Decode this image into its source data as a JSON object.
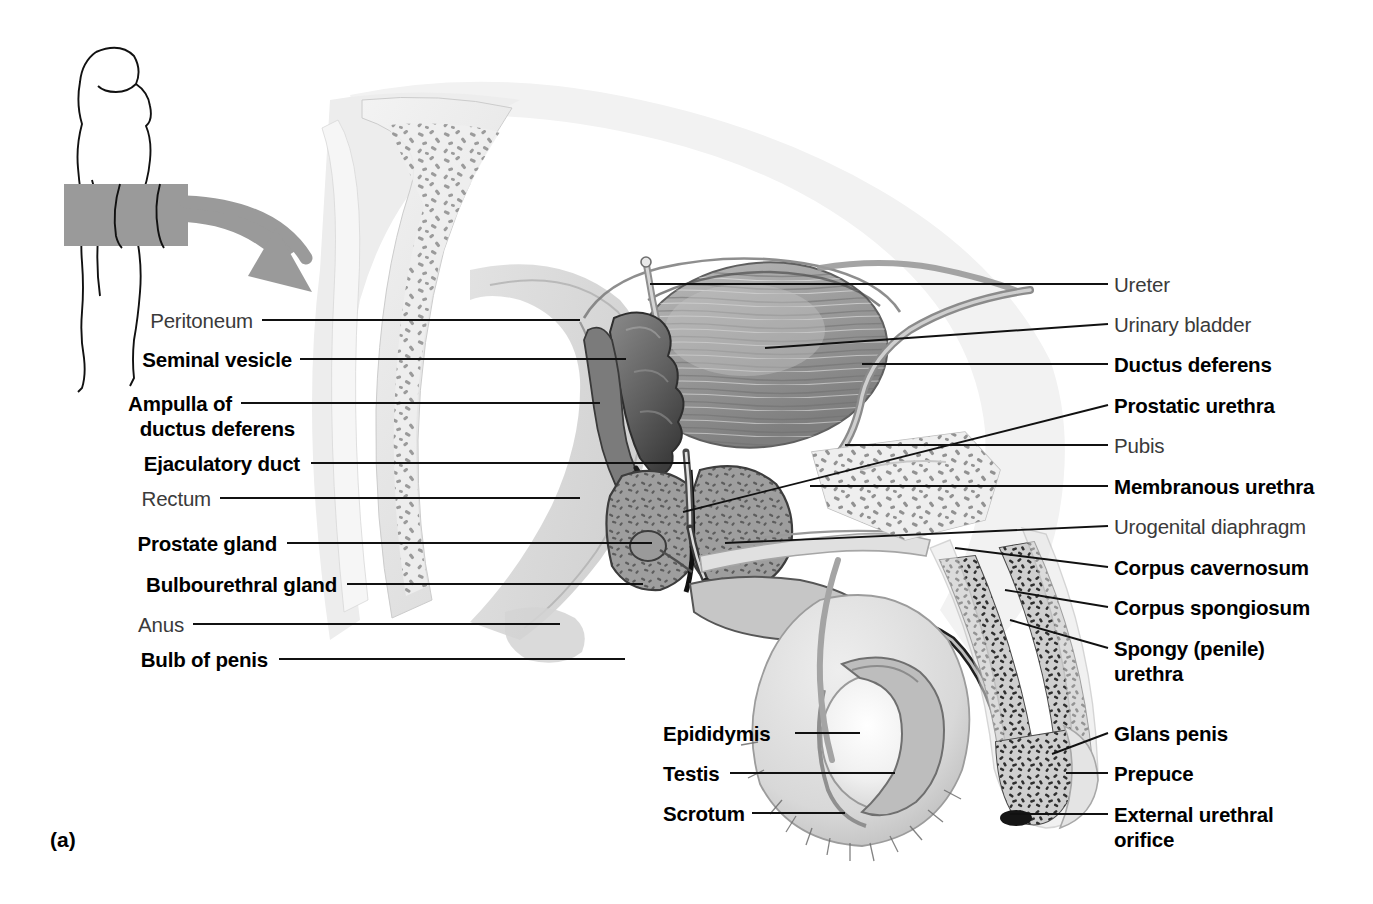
{
  "figure": {
    "letter": "(a)",
    "orientation_icon": "body-silhouette-icon",
    "pointer_icon": "curved-arrow-icon",
    "colors": {
      "background": "#ffffff",
      "line": "#111111",
      "accent_gray": "#9a9a9a",
      "label_bold": "#000000",
      "label_plain": "#3a3a3a"
    }
  },
  "labels_left": [
    {
      "text": "Peritoneum",
      "weight": "plain",
      "x": 253,
      "y": 309,
      "line_x1": 262,
      "line_y1": 320,
      "line_x2": 580,
      "line_y2": 320
    },
    {
      "text": "Seminal vesicle",
      "weight": "bold",
      "x": 292,
      "y": 348,
      "line_x1": 300,
      "line_y1": 359,
      "line_x2": 626,
      "line_y2": 359
    },
    {
      "text": "Ampulla of",
      "weight": "bold",
      "x": 232,
      "y": 392,
      "line_x1": 241,
      "line_y1": 403,
      "line_x2": 600,
      "line_y2": 403
    },
    {
      "text": "ductus deferens",
      "weight": "bold",
      "x": 295,
      "y": 417,
      "line_x1": null,
      "line_y1": null,
      "line_x2": null,
      "line_y2": null
    },
    {
      "text": "Ejaculatory duct",
      "weight": "bold",
      "x": 300,
      "y": 452,
      "line_x1": 311,
      "line_y1": 463,
      "line_x2": 690,
      "line_y2": 463
    },
    {
      "text": "Rectum",
      "weight": "plain",
      "x": 211,
      "y": 487,
      "line_x1": 220,
      "line_y1": 498,
      "line_x2": 580,
      "line_y2": 498
    },
    {
      "text": "Prostate gland",
      "weight": "bold",
      "x": 277,
      "y": 532,
      "line_x1": 287,
      "line_y1": 543,
      "line_x2": 652,
      "line_y2": 543
    },
    {
      "text": "Bulbourethral gland",
      "weight": "bold",
      "x": 337,
      "y": 573,
      "line_x1": 347,
      "line_y1": 584,
      "line_x2": 643,
      "line_y2": 584
    },
    {
      "text": "Anus",
      "weight": "plain",
      "x": 184,
      "y": 613,
      "line_x1": 193,
      "line_y1": 624,
      "line_x2": 560,
      "line_y2": 624
    },
    {
      "text": "Bulb of penis",
      "weight": "bold",
      "x": 268,
      "y": 648,
      "line_x1": 279,
      "line_y1": 659,
      "line_x2": 625,
      "line_y2": 659
    }
  ],
  "labels_center_bottom": [
    {
      "text": "Epididymis",
      "weight": "bold",
      "x": 663,
      "y": 722,
      "line_x1": 795,
      "line_y1": 733,
      "line_x2": 860,
      "line_y2": 733
    },
    {
      "text": "Testis",
      "weight": "bold",
      "x": 663,
      "y": 762,
      "line_x1": 730,
      "line_y1": 773,
      "line_x2": 895,
      "line_y2": 773
    },
    {
      "text": "Scrotum",
      "weight": "bold",
      "x": 663,
      "y": 802,
      "line_x1": 752,
      "line_y1": 813,
      "line_x2": 845,
      "line_y2": 813
    }
  ],
  "labels_right": [
    {
      "text": "Ureter",
      "weight": "plain",
      "x": 1114,
      "y": 273,
      "line_x1": 1108,
      "line_y1": 284,
      "line_x2": 650,
      "line_y2": 284
    },
    {
      "text": "Urinary bladder",
      "weight": "plain",
      "x": 1114,
      "y": 313,
      "line_x1": 1108,
      "line_y1": 324,
      "line_x2": 765,
      "line_y2": 348
    },
    {
      "text": "Ductus deferens",
      "weight": "bold",
      "x": 1114,
      "y": 353,
      "line_x1": 1108,
      "line_y1": 364,
      "line_x2": 862,
      "line_y2": 364
    },
    {
      "text": "Prostatic urethra",
      "weight": "bold",
      "x": 1114,
      "y": 394,
      "line_x1": 1108,
      "line_y1": 405,
      "line_x2": 683,
      "line_y2": 512
    },
    {
      "text": "Pubis",
      "weight": "plain",
      "x": 1114,
      "y": 434,
      "line_x1": 1108,
      "line_y1": 445,
      "line_x2": 845,
      "line_y2": 445
    },
    {
      "text": "Membranous urethra",
      "weight": "bold",
      "x": 1114,
      "y": 475,
      "line_x1": 1108,
      "line_y1": 486,
      "line_x2": 810,
      "line_y2": 486
    },
    {
      "text": "Urogenital diaphragm",
      "weight": "plain",
      "x": 1114,
      "y": 515,
      "line_x1": 1108,
      "line_y1": 526,
      "line_x2": 725,
      "line_y2": 543
    },
    {
      "text": "Corpus cavernosum",
      "weight": "bold",
      "x": 1114,
      "y": 556,
      "line_x1": 1108,
      "line_y1": 567,
      "line_x2": 955,
      "line_y2": 548
    },
    {
      "text": "Corpus spongiosum",
      "weight": "bold",
      "x": 1114,
      "y": 596,
      "line_x1": 1108,
      "line_y1": 607,
      "line_x2": 1005,
      "line_y2": 590
    },
    {
      "text": "Spongy (penile)",
      "weight": "bold",
      "x": 1114,
      "y": 637,
      "line_x1": 1108,
      "line_y1": 648,
      "line_x2": 1010,
      "line_y2": 620
    },
    {
      "text": "urethra",
      "weight": "bold",
      "x": 1114,
      "y": 662,
      "line_x1": null,
      "line_y1": null,
      "line_x2": null,
      "line_y2": null
    },
    {
      "text": "Glans penis",
      "weight": "bold",
      "x": 1114,
      "y": 722,
      "line_x1": 1108,
      "line_y1": 733,
      "line_x2": 1052,
      "line_y2": 754
    },
    {
      "text": "Prepuce",
      "weight": "bold",
      "x": 1114,
      "y": 762,
      "line_x1": 1108,
      "line_y1": 773,
      "line_x2": 1066,
      "line_y2": 773
    },
    {
      "text": "External urethral",
      "weight": "bold",
      "x": 1114,
      "y": 803,
      "line_x1": 1108,
      "line_y1": 814,
      "line_x2": 1010,
      "line_y2": 814
    },
    {
      "text": "orifice",
      "weight": "bold",
      "x": 1114,
      "y": 828,
      "line_x1": null,
      "line_y1": null,
      "line_x2": null,
      "line_y2": null
    }
  ],
  "structures": [
    "peritoneum",
    "seminal-vesicle",
    "ampulla-of-ductus-deferens",
    "ejaculatory-duct",
    "rectum",
    "prostate-gland",
    "bulbourethral-gland",
    "anus",
    "bulb-of-penis",
    "epididymis",
    "testis",
    "scrotum",
    "ureter",
    "urinary-bladder",
    "ductus-deferens",
    "prostatic-urethra",
    "pubis",
    "membranous-urethra",
    "urogenital-diaphragm",
    "corpus-cavernosum",
    "corpus-spongiosum",
    "spongy-penile-urethra",
    "glans-penis",
    "prepuce",
    "external-urethral-orifice",
    "sacrum"
  ]
}
